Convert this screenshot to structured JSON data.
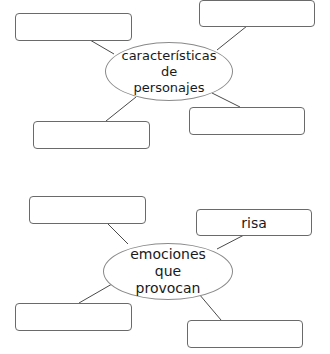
{
  "diagrams": [
    {
      "id": "personajes",
      "center": {
        "lines": [
          "características",
          "de",
          "personajes"
        ]
      },
      "boxes": [
        {
          "position": "top-left",
          "text": ""
        },
        {
          "position": "top-right",
          "text": ""
        },
        {
          "position": "bottom-left",
          "text": ""
        },
        {
          "position": "bottom-right",
          "text": ""
        }
      ]
    },
    {
      "id": "emociones",
      "center": {
        "lines": [
          "emociones",
          "que",
          "provocan"
        ]
      },
      "boxes": [
        {
          "position": "top-left",
          "text": ""
        },
        {
          "position": "top-right",
          "text": "risa"
        },
        {
          "position": "bottom-left",
          "text": ""
        },
        {
          "position": "bottom-right",
          "text": ""
        }
      ]
    }
  ],
  "colors": {
    "line": "#4a4a4a",
    "box_border": "#6a6a6a",
    "ellipse_border": "#8a8a8a",
    "text": "#1a1a1a",
    "background": "#ffffff"
  }
}
